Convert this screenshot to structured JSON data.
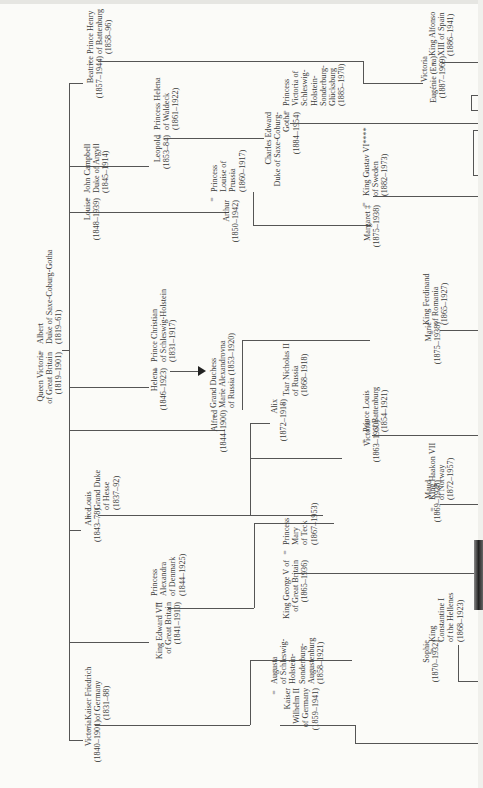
{
  "diagram": {
    "type": "family-tree",
    "orientation": "rotated-90-ccw",
    "root": {
      "person": "Queen Victoria of Great Britain (1819–1901)",
      "spouse": "Albert Duke of Saxe-Coburg-Gotha (1819–61)"
    },
    "nodes": {
      "victoria_qv": {
        "lines": [
          "Queen Victoria",
          "of Great Britain",
          "(1819–1901)"
        ]
      },
      "albert": {
        "lines": [
          "Albert",
          "Duke of Saxe-Coburg-Gotha",
          "(1819–61)"
        ]
      },
      "beatrice": {
        "lines": [
          "Beatrice",
          "(1857–1944)"
        ]
      },
      "henry_battenberg": {
        "lines": [
          "Prince Henry",
          "of Battenburg",
          "(1858–96)"
        ]
      },
      "leopold": {
        "lines": [
          "Leopold",
          "(1853–84)"
        ]
      },
      "helena_waldeck": {
        "lines": [
          "Princess Helena",
          "of Waldeck",
          "(1861–1922)"
        ]
      },
      "louise": {
        "lines": [
          "Louise",
          "(1848–1939)"
        ]
      },
      "john_campbell": {
        "lines": [
          "John Campbell",
          "Duke of Argyll",
          "(1845–1914)"
        ]
      },
      "arthur": {
        "lines": [
          "Arthur",
          "(1850–1942)"
        ]
      },
      "louise_prussia": {
        "lines": [
          "Princess",
          "Louise of",
          "Prussia",
          "(1860–1917)"
        ]
      },
      "helena": {
        "lines": [
          "Helena",
          "(1846–1923)"
        ]
      },
      "christian": {
        "lines": [
          "Prince Christian",
          "of Schleswig-Holstein",
          "(1831–1917)"
        ]
      },
      "alfred": {
        "lines": [
          "Alfred",
          "(1844–1900)"
        ]
      },
      "maria_alexandrovna": {
        "lines": [
          "Grand Duchess",
          "Marie Alexandrovna",
          "of Russia (1853–1920)"
        ]
      },
      "alice": {
        "lines": [
          "Alice",
          "(1843–78)"
        ]
      },
      "louis_hesse": {
        "lines": [
          "Louis",
          "Grand Duke",
          "of Hesse",
          "(1837–92)"
        ]
      },
      "edward_vii": {
        "lines": [
          "King Edward VII",
          "of Great Britain",
          "(1841–1910)"
        ]
      },
      "alexandra": {
        "lines": [
          "Princess",
          "Alexandra",
          "of Denmark",
          "(1844–1925)"
        ]
      },
      "victoria_pr": {
        "lines": [
          "Victoria",
          "(1840–1901)"
        ]
      },
      "friedrich": {
        "lines": [
          "Kaiser Friedrich",
          "of Germany",
          "(1831–88)"
        ]
      },
      "charles_edward": {
        "lines": [
          "Charles Edward",
          "Duke of Saxe-Coburg-",
          "Gotha",
          "(1884–1954)"
        ]
      },
      "victoria_sh": {
        "lines": [
          "Princess",
          "Victoria of",
          "Schleswig-",
          "Holstein-",
          "Sonderburg-",
          "Glücksburg",
          "(1885–1970)"
        ]
      },
      "victoria_eugenie": {
        "lines": [
          "Victoria",
          "Eugénie (Ena)",
          "(1887–1969)"
        ]
      },
      "alfonso": {
        "lines": [
          "King Alfonso",
          "XIII of Spain",
          "(1886–1941)"
        ]
      },
      "margaret": {
        "lines": [
          "Margaret ‡",
          "(1875–1938)"
        ]
      },
      "gustav": {
        "lines": [
          "King Gustav VI****",
          "of Sweden",
          "(1882–1973)"
        ]
      },
      "alix": {
        "lines": [
          "Alix",
          "(1872–1918)"
        ]
      },
      "nicholas": {
        "lines": [
          "Tsar Nicholas II",
          "of Russia",
          "(1868–1918)"
        ]
      },
      "marie": {
        "lines": [
          "Marie",
          "(1875–1938)"
        ]
      },
      "ferdinand": {
        "lines": [
          "King Ferdinand",
          "of Romania",
          "(1865–1927)"
        ]
      },
      "victoria_h": {
        "lines": [
          "Victoria",
          "(1863–1950)"
        ]
      },
      "louis_battenberg": {
        "lines": [
          "Prince Louis",
          "of Battenburg",
          "(1854–1921)"
        ]
      },
      "george_v": {
        "lines": [
          "King George V of",
          "of Great Britain",
          "(1865–1936)"
        ]
      },
      "mary_teck": {
        "lines": [
          "Princess",
          "Mary",
          "of Teck",
          "(1867–1953)"
        ]
      },
      "maud": {
        "lines": [
          "Maud",
          "(1869–1938)"
        ]
      },
      "haakon": {
        "lines": [
          "King Haakon VII",
          "of Norway",
          "(1872–1957)"
        ]
      },
      "wilhelm": {
        "lines": [
          "Kaiser",
          "Wilhelm II",
          "of Germany",
          "(1859–1941)"
        ]
      },
      "augusta": {
        "lines": [
          "Augusta",
          "of Schleswig-",
          "Holstein-",
          "Sonderburg-",
          "Augustenburg",
          "(1858–1921)"
        ]
      },
      "sophie": {
        "lines": [
          "Sophie",
          "(1870–1932)"
        ]
      },
      "constantine": {
        "lines": [
          "King",
          "Constantine I",
          "of the Hellenes",
          "(1868–1923)"
        ]
      }
    },
    "marriage_symbol": "=",
    "children_of_victoria": [
      "Victoria",
      "Edward VII",
      "Alice",
      "Alfred",
      "Helena",
      "Louise",
      "Arthur",
      "Leopold",
      "Beatrice"
    ]
  }
}
